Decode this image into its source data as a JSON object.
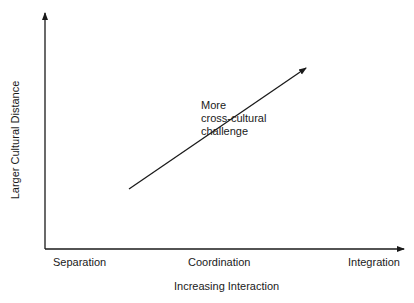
{
  "diagram": {
    "y_axis_label": "Larger Cultural Distance",
    "x_axis_label": "Increasing Interaction",
    "x_ticks": [
      "Separation",
      "Coordination",
      "Integration"
    ],
    "annotation": {
      "lines": [
        "More",
        "cross-cultural",
        "challenge"
      ]
    },
    "arrow": {
      "from": [
        129,
        189
      ],
      "to": [
        306,
        68
      ],
      "meaning": "More cross-cultural challenge"
    },
    "colors": {
      "line": "#1a1a1a",
      "background": "#ffffff"
    }
  }
}
